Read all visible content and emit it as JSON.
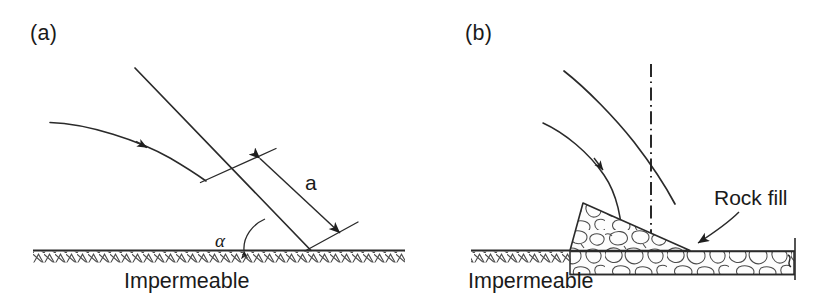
{
  "figure": {
    "background_color": "#ffffff",
    "line_color": "#1f1f1f",
    "rock_fill_color": "#fdfdfd",
    "width": 838,
    "height": 304
  },
  "panel_a": {
    "label": "(a)",
    "labels": {
      "dimension_a": "a",
      "angle_alpha": "α",
      "base": "Impermeable"
    },
    "icon_names": {
      "phreatic_curve": "phreatic-surface-curve-icon",
      "slope_line": "downstream-slope-line-icon",
      "dimension_arrow": "dimension-double-arrow-icon",
      "angle_arc": "angle-arc-arrow-icon",
      "hatch": "impermeable-hatching-icon"
    }
  },
  "panel_b": {
    "label": "(b)",
    "labels": {
      "rock_fill": "Rock fill",
      "base": "Impermeable"
    },
    "icon_names": {
      "phreatic_curve": "phreatic-surface-curve-icon",
      "slope_line": "downstream-slope-line-icon",
      "centerline": "dash-dot-centerline-icon",
      "leader_arrow": "rock-fill-leader-arrow-icon",
      "rock_fill_pattern": "rock-fill-pattern-icon",
      "hatch": "impermeable-hatching-icon",
      "break_line": "break-line-icon"
    }
  }
}
